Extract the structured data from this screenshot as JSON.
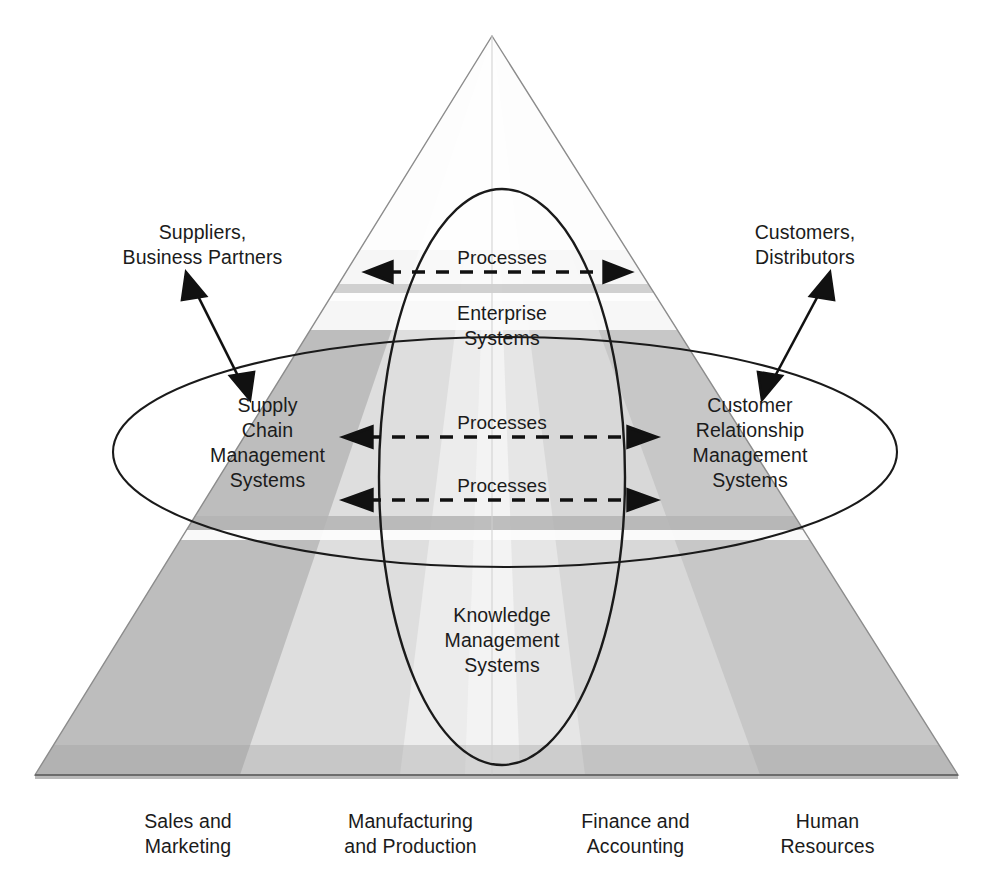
{
  "figure": {
    "kind": "pyramid-enterprise-systems-diagram",
    "background": "#ffffff",
    "line_color": "#1a1a1a"
  },
  "colors": {
    "pyramid_light": "#ededed",
    "pyramid_lighter": "#f7f7f7",
    "pyramid_mid": "#d9d9d9",
    "pyramid_dark": "#bdbdbd",
    "pyramid_darker": "#a8a8a8",
    "base_edge": "#9a9a9a",
    "outline": "#8c8c8c",
    "text": "#1b1b1b"
  },
  "external_labels": {
    "left": "Suppliers,\nBusiness Partners",
    "right": "Customers,\nDistributors"
  },
  "system_labels": {
    "supply_chain": "Supply\nChain\nManagement\nSystems",
    "customer_relationship": "Customer\nRelationship\nManagement\nSystems",
    "enterprise": "Enterprise\nSystems",
    "knowledge": "Knowledge\nManagement\nSystems"
  },
  "process_labels": [
    {
      "id": "process-top",
      "text": "Processes"
    },
    {
      "id": "process-middle",
      "text": "Processes"
    },
    {
      "id": "process-lower",
      "text": "Processes"
    }
  ],
  "functional_areas": [
    {
      "id": "sales-marketing",
      "text": "Sales and\nMarketing"
    },
    {
      "id": "manufacturing-production",
      "text": "Manufacturing\nand Production"
    },
    {
      "id": "finance-accounting",
      "text": "Finance and\nAccounting"
    },
    {
      "id": "human-resources",
      "text": "Human\nResources"
    }
  ],
  "connectors": {
    "left_double_arrow": "supplier-connector",
    "right_double_arrow": "customer-connector",
    "horizontal_dashed": "process-flow-arrow"
  }
}
